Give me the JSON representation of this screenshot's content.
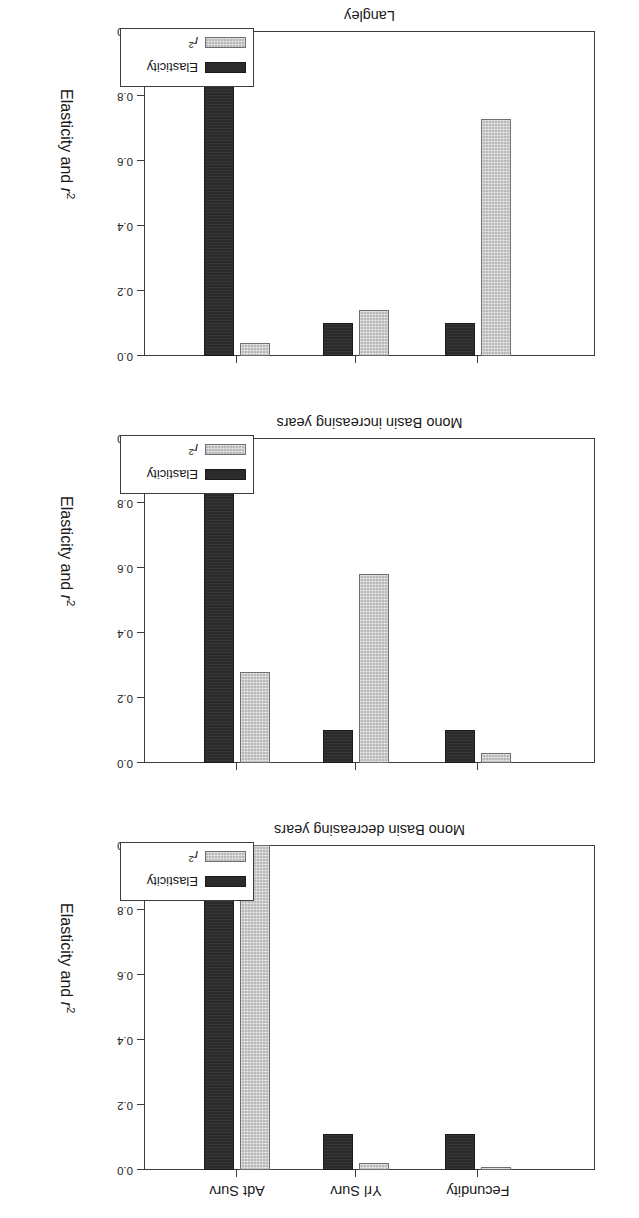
{
  "chart_data": {
    "type": "bar",
    "title": "",
    "subtitle": "",
    "xlabel": "",
    "ylabel": "Elasticity and r 2",
    "ylabel_main": "Elasticity and ",
    "ylabel_symbol": "r",
    "ylabel_exponent": "2",
    "ylim": [
      0.0,
      1.0
    ],
    "yticks": [
      "0.0",
      "0.2",
      "0.4",
      "0.6",
      "0.8",
      "1.0"
    ],
    "ytick_values": [
      0.0,
      0.2,
      0.4,
      0.6,
      0.8,
      1.0
    ],
    "grid": false,
    "legend_position": "bottom-right",
    "legend": [
      {
        "name": "Elasticity",
        "color": "#2b2b2b"
      },
      {
        "name": "r 2",
        "label_symbol": "r",
        "label_exponent": "2",
        "color": "#b9b9b9"
      }
    ],
    "categories": [
      "Fecundity",
      "Yrl Surv",
      "Adt Surv"
    ],
    "panels": [
      {
        "name": "Mono Basin decreasing years",
        "series": [
          {
            "name": "Elasticity",
            "values": [
              0.11,
              0.11,
              0.94
            ]
          },
          {
            "name": "r 2",
            "values": [
              0.01,
              0.02,
              1.0
            ]
          }
        ]
      },
      {
        "name": "Mono Basin increasing years",
        "series": [
          {
            "name": "Elasticity",
            "values": [
              0.1,
              0.1,
              0.87
            ]
          },
          {
            "name": "r 2",
            "values": [
              0.03,
              0.58,
              0.28
            ]
          }
        ]
      },
      {
        "name": "Langley",
        "series": [
          {
            "name": "Elasticity",
            "values": [
              0.1,
              0.1,
              0.86
            ]
          },
          {
            "name": "r 2",
            "values": [
              0.73,
              0.14,
              0.04
            ]
          }
        ]
      }
    ]
  },
  "figure": {
    "panel_order": [
      "Mono Basin decreasing years",
      "Mono Basin increasing years",
      "Langley"
    ],
    "orientation_note": "rotated-180"
  }
}
